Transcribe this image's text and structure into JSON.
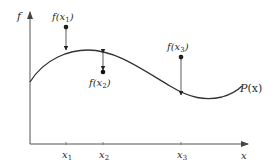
{
  "diagram": {
    "axes": {
      "y_label": "f",
      "x_label": "x"
    },
    "curve": {
      "label_main": "P",
      "label_arg": "(x)"
    },
    "points": [
      {
        "label_f": "f(",
        "label_x": "x",
        "label_sub": "1",
        "label_close": ")",
        "tick_label": "x",
        "tick_sub": "1"
      },
      {
        "label_f": "f(",
        "label_x": "x",
        "label_sub": "2",
        "label_close": ")",
        "tick_label": "x",
        "tick_sub": "2"
      },
      {
        "label_f": "f(",
        "label_x": "x",
        "label_sub": "3",
        "label_close": ")",
        "tick_label": "x",
        "tick_sub": "3"
      }
    ],
    "colors": {
      "line": "#333333",
      "axis": "#555555",
      "dot": "#111111"
    }
  }
}
